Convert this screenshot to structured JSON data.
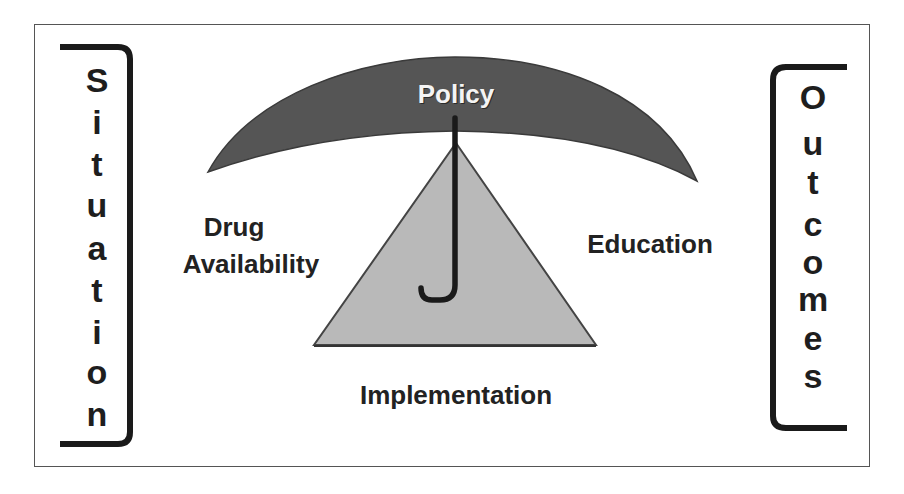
{
  "diagram": {
    "canopy": {
      "label": "Policy",
      "fill": "#555555",
      "text_color": "#f4f4f4"
    },
    "triangle": {
      "fill": "#b9b9b9",
      "stroke": "#444444"
    },
    "handle": {
      "color": "#1a1a1a"
    },
    "left_label": {
      "line1": "Drug",
      "line2": "Availability"
    },
    "right_label": "Education",
    "bottom_label": "Implementation",
    "left_bracket": {
      "word": "Situation",
      "letters": [
        "S",
        "i",
        "t",
        "u",
        "a",
        "t",
        "i",
        "o",
        "n"
      ]
    },
    "right_bracket": {
      "word": "Outcomes",
      "letters": [
        "O",
        "u",
        "t",
        "c",
        "o",
        "m",
        "e",
        "s"
      ]
    },
    "colors": {
      "text": "#222222",
      "frame": "#555555",
      "bracket": "#1a1a1a",
      "background": "#ffffff"
    }
  }
}
